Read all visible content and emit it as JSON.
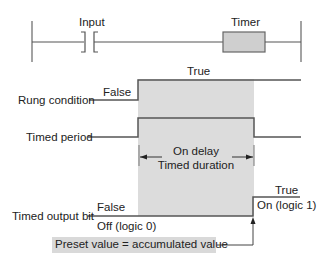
{
  "ladder": {
    "input_label": "Input",
    "timer_label": "Timer"
  },
  "signals": {
    "rung_condition": {
      "label": "Rung condition",
      "low_state": "False",
      "high_state": "True"
    },
    "timed_period": {
      "label": "Timed period"
    },
    "timed_output_bit": {
      "label": "Timed output bit",
      "low_state": "False",
      "low_detail": "Off (logic 0)",
      "high_state": "True",
      "high_detail": "On (logic 1)"
    }
  },
  "duration": {
    "line1": "On delay",
    "line2": "Timed duration"
  },
  "preset_note": "Preset value = accumulated value",
  "colors": {
    "shade": "#dcdcdc",
    "line": "#555555",
    "timer_fill": "#cfcfcf",
    "preset_fill": "#d9d9d9"
  }
}
